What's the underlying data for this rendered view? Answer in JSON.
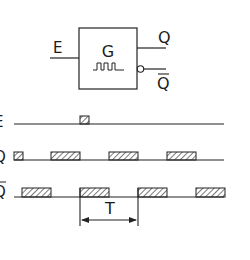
{
  "gate": {
    "label": "G",
    "input_label": "E",
    "output_label": "Q",
    "inverted_output_label": "Q",
    "symbol": "pulse-train-icon"
  },
  "timing": {
    "signals": [
      {
        "name": "E",
        "pulses": [
          [
            80,
            89
          ]
        ]
      },
      {
        "name": "Q",
        "pulses": [
          [
            14,
            23
          ],
          [
            51,
            80
          ],
          [
            109,
            138
          ],
          [
            167,
            196
          ]
        ]
      },
      {
        "name": "Q",
        "inverted": true,
        "pulses": [
          [
            22,
            51
          ],
          [
            80,
            109
          ],
          [
            138,
            167
          ],
          [
            196,
            225
          ]
        ]
      }
    ],
    "period_label": "T"
  },
  "colors": {
    "stroke": "#222222",
    "hatch": "#333333"
  }
}
